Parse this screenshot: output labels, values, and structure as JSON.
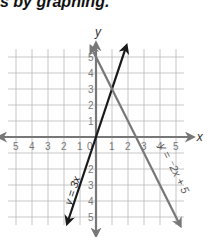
{
  "page": {
    "heading": "s by graphing."
  },
  "chart_data": {
    "type": "line",
    "title": "",
    "xlabel": "x",
    "ylabel": "y",
    "xlim": [
      -5,
      5
    ],
    "ylim": [
      -5,
      5
    ],
    "grid": true,
    "x_ticks": [
      "5",
      "4",
      "3",
      "2",
      "1",
      "0",
      "1",
      "2",
      "3",
      "4",
      "5"
    ],
    "x_tick_values": [
      -5,
      -4,
      -3,
      -2,
      -1,
      0,
      1,
      2,
      3,
      4,
      5
    ],
    "y_ticks_positive": [
      "1",
      "2",
      "3",
      "4",
      "5"
    ],
    "y_ticks_negative": [
      "2",
      "3",
      "4",
      "5"
    ],
    "series": [
      {
        "name": "y = 3x",
        "label": "y = 3x",
        "equation": "y = 3x",
        "slope": 3,
        "intercept": 0,
        "color": "#1a1a1a",
        "points": [
          [
            -2,
            -6
          ],
          [
            -1,
            -3
          ],
          [
            0,
            0
          ],
          [
            1,
            3
          ],
          [
            2,
            6
          ]
        ]
      },
      {
        "name": "y = -2x + 5",
        "label": "y = ⁻2x + 5",
        "equation": "y = -2x + 5",
        "slope": -2,
        "intercept": 5,
        "color": "#777777",
        "points": [
          [
            -0.2,
            5.4
          ],
          [
            0,
            5
          ],
          [
            1,
            3
          ],
          [
            2,
            1
          ],
          [
            2.5,
            0
          ],
          [
            3,
            -1
          ],
          [
            4,
            -3
          ],
          [
            5,
            -5
          ]
        ]
      }
    ],
    "intersection": [
      1,
      3
    ],
    "legend": "inline labels along lines"
  }
}
